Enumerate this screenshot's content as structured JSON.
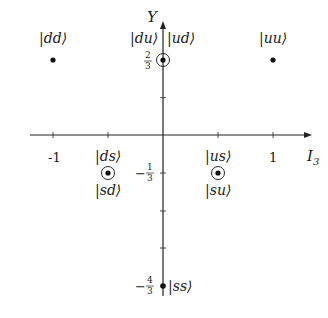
{
  "diagram": {
    "axes": {
      "x_label": "I",
      "x_label_sub": "3",
      "y_label": "Y",
      "x_ticks": [
        {
          "label": "-1",
          "value": -1
        },
        {
          "label": "",
          "value": -0.5
        },
        {
          "label": "",
          "value": 0.5
        },
        {
          "label": "1",
          "value": 1
        }
      ],
      "y_ticks": [
        {
          "value": 0.6667,
          "sign": "",
          "num": "2",
          "den": "3"
        },
        {
          "value": 0.3333,
          "sign": "",
          "num": "",
          "den": ""
        },
        {
          "value": -0.3333,
          "sign": "−",
          "num": "1",
          "den": "3"
        },
        {
          "value": -0.6667,
          "sign": "",
          "num": "",
          "den": ""
        },
        {
          "value": -1.0,
          "sign": "",
          "num": "",
          "den": ""
        },
        {
          "value": -1.3333,
          "sign": "−",
          "num": "4",
          "den": "3"
        }
      ]
    },
    "states": [
      {
        "label": "|dd⟩",
        "I3": -1,
        "Y": 0.6667,
        "circled": false
      },
      {
        "label": "|uu⟩",
        "I3": 1,
        "Y": 0.6667,
        "circled": false
      },
      {
        "label_top_left": "|du⟩",
        "label_top_right": "|ud⟩",
        "I3": 0,
        "Y": 0.6667,
        "circled": true
      },
      {
        "label_top": "|ds⟩",
        "label_bottom": "|sd⟩",
        "I3": -0.5,
        "Y": -0.3333,
        "circled": true
      },
      {
        "label_top": "|us⟩",
        "label_bottom": "|su⟩",
        "I3": 0.5,
        "Y": -0.3333,
        "circled": true
      },
      {
        "label": "|ss⟩",
        "I3": 0,
        "Y": -1.3333,
        "circled": false
      }
    ]
  }
}
